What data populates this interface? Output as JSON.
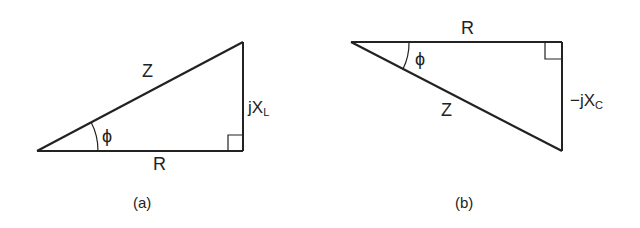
{
  "diagrams": [
    {
      "id": "a",
      "caption": "(a)",
      "hypotenuse_label": "Z",
      "base_label": "R",
      "vertical_label_main": "jX",
      "vertical_label_sub": "L",
      "angle_label": "ϕ",
      "description": "Impedance triangle for inductive circuit: R horizontal, jX_L upward, Z hypotenuse"
    },
    {
      "id": "b",
      "caption": "(b)",
      "hypotenuse_label": "Z",
      "base_label": "R",
      "vertical_label_main": "−jX",
      "vertical_label_sub": "C",
      "angle_label": "ϕ",
      "description": "Impedance triangle for capacitive circuit: R horizontal, −jX_C downward, Z hypotenuse"
    }
  ],
  "colors": {
    "line": "#222222",
    "background": "#ffffff"
  }
}
